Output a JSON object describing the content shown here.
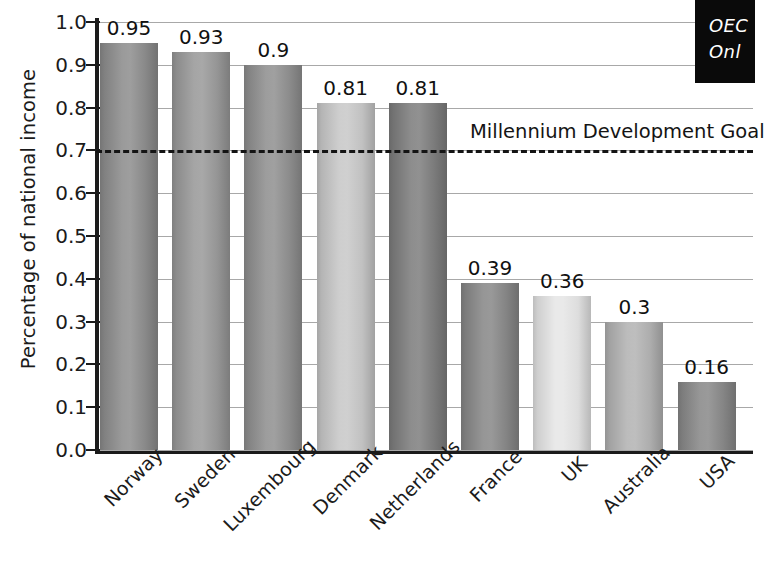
{
  "chart_data": {
    "type": "bar",
    "title": "",
    "xlabel": "",
    "ylabel": "Percentage of national income",
    "categories": [
      "Norway",
      "Sweden",
      "Luxembourg",
      "Denmark",
      "Netherlands",
      "France",
      "UK",
      "Australia",
      "USA"
    ],
    "values": [
      0.95,
      0.93,
      0.9,
      0.81,
      0.81,
      0.39,
      0.36,
      0.3,
      0.16
    ],
    "value_labels": [
      "0.95",
      "0.93",
      "0.9",
      "0.81",
      "0.81",
      "0.39",
      "0.36",
      "0.3",
      "0.16"
    ],
    "bar_colors": [
      "#8f8f8f",
      "#9b9b9b",
      "#929292",
      "#c9c9c9",
      "#808080",
      "#8a8a8a",
      "#e6e6e6",
      "#b4b4b4",
      "#8b8b8b"
    ],
    "ylim": [
      0.0,
      1.0
    ],
    "yticks": [
      0.0,
      0.1,
      0.2,
      0.3,
      0.4,
      0.5,
      0.6,
      0.7,
      0.8,
      0.9,
      1.0
    ],
    "ytick_labels": [
      "0.0",
      "0.1",
      "0.2",
      "0.3",
      "0.4",
      "0.5",
      "0.6",
      "0.7",
      "0.8",
      "0.9",
      "1.0"
    ],
    "grid": true,
    "legend": "none",
    "annotations": [
      {
        "name": "millennium-development-goal",
        "label": "Millennium Development Goal",
        "value": 0.7,
        "style": "dashed-horizontal-line"
      }
    ]
  },
  "axis": {
    "y_title": "Percentage of national income"
  },
  "goal": {
    "label": "Millennium Development Goal",
    "value": 0.7
  },
  "watermark": {
    "line1": "OEC",
    "line2": "Onl"
  }
}
